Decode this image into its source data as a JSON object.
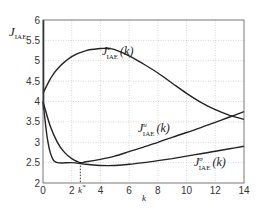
{
  "chart_data": {
    "type": "line",
    "title": "",
    "xlabel": "k",
    "ylabel": "J_IAE",
    "xlim": [
      0,
      14
    ],
    "ylim": [
      2,
      6
    ],
    "grid": true,
    "x_ticks": [
      "0",
      "2",
      "4",
      "6",
      "8",
      "10",
      "12",
      "14"
    ],
    "y_ticks": [
      "2",
      "2.5",
      "3",
      "3.5",
      "4",
      "4.5",
      "5",
      "5.5",
      "6"
    ],
    "annotations": [
      {
        "text": "k*",
        "x": 2.6,
        "type": "dotted vertical marker"
      }
    ],
    "series": [
      {
        "name": "J^v_IAE(k)",
        "label_sup": "v",
        "x": [
          0,
          0.5,
          1,
          2,
          3,
          4,
          4.5,
          5,
          6,
          7,
          8,
          9,
          10,
          11,
          12,
          13,
          14
        ],
        "y": [
          4.2,
          4.55,
          4.8,
          5.1,
          5.25,
          5.3,
          5.3,
          5.27,
          5.12,
          4.92,
          4.7,
          4.45,
          4.2,
          3.98,
          3.8,
          3.66,
          3.56
        ]
      },
      {
        "name": "J^u_IAE(k)",
        "label_sup": "u",
        "x": [
          0,
          0.5,
          1,
          1.5,
          2,
          2.6,
          3,
          4,
          5,
          6,
          7,
          8,
          9,
          10,
          11,
          12,
          13,
          14
        ],
        "y": [
          4.0,
          3.4,
          3.0,
          2.75,
          2.6,
          2.5,
          2.52,
          2.58,
          2.66,
          2.77,
          2.88,
          3.0,
          3.12,
          3.24,
          3.36,
          3.49,
          3.62,
          3.75
        ]
      },
      {
        "name": "J^σ_IAE(k)",
        "label_sup": "σ",
        "x": [
          0,
          0.3,
          0.6,
          1,
          2,
          3,
          4,
          5,
          6,
          7,
          8,
          9,
          10,
          11,
          12,
          13,
          14
        ],
        "y": [
          4.0,
          3.1,
          2.65,
          2.5,
          2.5,
          2.46,
          2.43,
          2.43,
          2.46,
          2.5,
          2.55,
          2.6,
          2.66,
          2.72,
          2.78,
          2.84,
          2.9
        ]
      }
    ],
    "legend": "inline labels"
  },
  "labels": {
    "ylabel_main": "J",
    "ylabel_sub": "IAE",
    "xlabel": "k",
    "kstar_main": "k",
    "kstar_sup": "*",
    "series_label_main": "J",
    "series_label_sub": "IAE",
    "series_label_arg": "(k)",
    "v_sup": "v",
    "u_sup": "u",
    "s_sup": "σ"
  }
}
